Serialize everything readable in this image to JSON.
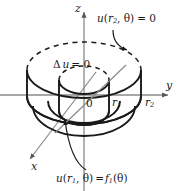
{
  "figure": {
    "kind": "annulus-cylinder-3d-diagram",
    "background": "#ffffff",
    "stroke": "#1a1a1a",
    "axis_color": "#7a7a7a"
  },
  "axes": {
    "z_label": "z",
    "y_label": "y",
    "x_label": "x",
    "origin_label": "0"
  },
  "radii": {
    "inner_label": "r",
    "inner_sub": "1",
    "outer_label": "r",
    "outer_sub": "2"
  },
  "annotations": {
    "pde": {
      "op": "Δ",
      "fn": "u",
      "eq": "= 0"
    },
    "outer_bc": {
      "fn": "u",
      "open": "(",
      "arg": "r",
      "arg_sub": "2",
      "theta": ", θ)",
      "eq": "= 0"
    },
    "inner_bc": {
      "fn": "u",
      "open": "(",
      "arg": "r",
      "arg_sub": "1",
      "theta": ", θ)",
      "eq": "=",
      "rhs_fn": "f",
      "rhs_sub": "1",
      "rhs_arg": "(θ)"
    }
  }
}
